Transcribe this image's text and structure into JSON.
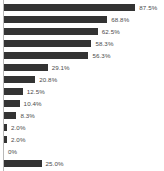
{
  "chart_data": {
    "type": "bar",
    "orientation": "horizontal",
    "title": "",
    "subtitle": "",
    "xlabel": "",
    "ylabel": "",
    "grid": false,
    "legend": null,
    "axis_line": "left vertical light gray",
    "bar_color": "#333333",
    "label_color": "#4a4a4a",
    "background": "#ffffff",
    "xlim": [
      0,
      100
    ],
    "value_label_suffix": "%",
    "note": "Bottom bar (25.0%) is clipped by the image edge; its label is partially cut off.",
    "categories": [
      "",
      "",
      "",
      "",
      "",
      "",
      "",
      "",
      "",
      "",
      "",
      "",
      "",
      ""
    ],
    "values": [
      87.5,
      68.8,
      62.5,
      58.3,
      56.3,
      29.1,
      20.8,
      12.5,
      10.4,
      8.3,
      2.0,
      2.0,
      0,
      25.0
    ],
    "labels": [
      "87.5%",
      "68.8%",
      "62.5%",
      "58.3%",
      "56.3%",
      "29.1%",
      "20.8%",
      "12.5%",
      "10.4%",
      "8.3%",
      "2.0%",
      "2.0%",
      "0%",
      "25.0%"
    ],
    "bars": [
      {
        "label": "87.5%",
        "value": 87.5
      },
      {
        "label": "68.8%",
        "value": 68.8
      },
      {
        "label": "62.5%",
        "value": 62.5
      },
      {
        "label": "58.3%",
        "value": 58.3
      },
      {
        "label": "56.3%",
        "value": 56.3
      },
      {
        "label": "29.1%",
        "value": 29.1
      },
      {
        "label": "20.8%",
        "value": 20.8
      },
      {
        "label": "12.5%",
        "value": 12.5
      },
      {
        "label": "10.4%",
        "value": 10.4
      },
      {
        "label": "8.3%",
        "value": 8.3
      },
      {
        "label": "2.0%",
        "value": 2.0
      },
      {
        "label": "2.0%",
        "value": 2.0
      },
      {
        "label": "0%",
        "value": 0
      },
      {
        "label": "25.0%",
        "value": 25.0
      }
    ]
  }
}
